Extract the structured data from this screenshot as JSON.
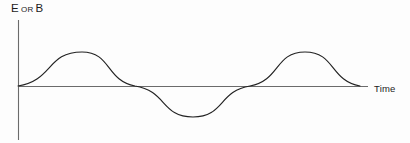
{
  "figure": {
    "background_color": "#fdfdfd",
    "line_color": "#222222",
    "axis_color": "#6b6b6b",
    "text_color": "#1c1c1c",
    "y_axis_label_main_1": "E",
    "y_axis_label_conjunction": "OR",
    "y_axis_label_main_2": "B",
    "x_axis_label": "Time"
  },
  "chart_data": {
    "type": "line",
    "title": "",
    "subtitle": "",
    "xlabel": "Time",
    "ylabel": "E OR B",
    "grid": false,
    "legend": null,
    "legend_position": "none",
    "annotations": [],
    "xtick_labels": [],
    "ytick_labels": [],
    "axis_origin_px": [
      18,
      86
    ],
    "x_axis_extent_px": [
      18,
      368
    ],
    "y_axis_extent_px": [
      20,
      140
    ],
    "xlim": [
      0,
      2.0
    ],
    "ylim": [
      -1.15,
      1.45
    ],
    "waveform": {
      "function": "sine",
      "amplitude": 1.0,
      "cycles_shown": 1.86,
      "period_units": 1.0,
      "phase": 0.0
    },
    "x": [
      0.0,
      0.0625,
      0.125,
      0.1875,
      0.25,
      0.3125,
      0.375,
      0.4375,
      0.5,
      0.5625,
      0.625,
      0.6875,
      0.75,
      0.8125,
      0.875,
      0.9375,
      1.0,
      1.0625,
      1.125,
      1.1875,
      1.25,
      1.3125,
      1.375,
      1.4375,
      1.5,
      1.5625,
      1.625,
      1.6875,
      1.75,
      1.8125,
      1.86
    ],
    "y": [
      0.0,
      0.383,
      0.707,
      0.924,
      1.0,
      0.924,
      0.707,
      0.383,
      0.0,
      -0.383,
      -0.707,
      -0.924,
      -1.0,
      -0.924,
      -0.707,
      -0.383,
      0.0,
      0.383,
      0.707,
      0.924,
      1.0,
      0.924,
      0.707,
      0.383,
      0.0,
      -0.383,
      -0.707,
      -0.924,
      -1.0,
      -0.924,
      -0.77
    ],
    "key_points_px": {
      "start": [
        18,
        86
      ],
      "peak_1": [
        82,
        52
      ],
      "zero_crossing_1": [
        135,
        86
      ],
      "trough_1": [
        193,
        117
      ],
      "zero_crossing_2": [
        250,
        86
      ],
      "peak_2": [
        305,
        52
      ],
      "end": [
        360,
        86
      ]
    }
  }
}
